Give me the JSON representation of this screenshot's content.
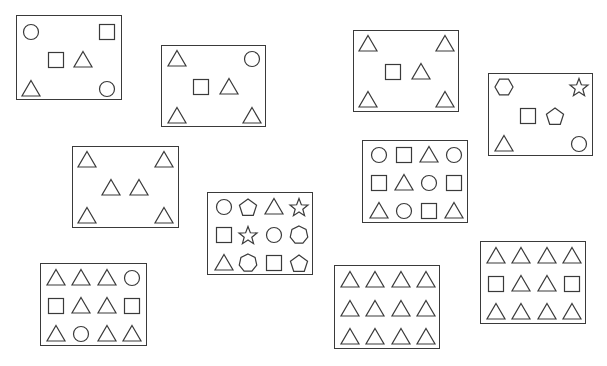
{
  "diagram": {
    "stroke_color": "#3a3a3a",
    "background_color": "#ffffff",
    "panels": [
      {
        "id": "panel-1",
        "box": [
          16,
          15,
          106,
          85
        ],
        "shapes": [
          {
            "type": "circle",
            "x": 14,
            "y": 16
          },
          {
            "type": "square",
            "x": 90,
            "y": 16
          },
          {
            "type": "square",
            "x": 39,
            "y": 44
          },
          {
            "type": "triangle",
            "x": 66,
            "y": 44
          },
          {
            "type": "triangle",
            "x": 14,
            "y": 73
          },
          {
            "type": "circle",
            "x": 90,
            "y": 73
          }
        ]
      },
      {
        "id": "panel-2",
        "box": [
          161,
          45,
          105,
          82
        ],
        "shapes": [
          {
            "type": "triangle",
            "x": 15,
            "y": 13
          },
          {
            "type": "circle",
            "x": 90,
            "y": 13
          },
          {
            "type": "square",
            "x": 39,
            "y": 41
          },
          {
            "type": "triangle",
            "x": 67,
            "y": 41
          },
          {
            "type": "triangle",
            "x": 15,
            "y": 70
          },
          {
            "type": "triangle",
            "x": 90,
            "y": 70
          }
        ]
      },
      {
        "id": "panel-3",
        "box": [
          353,
          30,
          106,
          82
        ],
        "shapes": [
          {
            "type": "triangle",
            "x": 14,
            "y": 13
          },
          {
            "type": "triangle",
            "x": 91,
            "y": 13
          },
          {
            "type": "square",
            "x": 39,
            "y": 41
          },
          {
            "type": "triangle",
            "x": 67,
            "y": 41
          },
          {
            "type": "triangle",
            "x": 14,
            "y": 69
          },
          {
            "type": "triangle",
            "x": 91,
            "y": 69
          }
        ]
      },
      {
        "id": "panel-4",
        "box": [
          488,
          73,
          105,
          83
        ],
        "shapes": [
          {
            "type": "hexagon",
            "x": 15,
            "y": 13
          },
          {
            "type": "star",
            "x": 90,
            "y": 13
          },
          {
            "type": "square",
            "x": 39,
            "y": 42
          },
          {
            "type": "pentagon",
            "x": 66,
            "y": 42
          },
          {
            "type": "triangle",
            "x": 15,
            "y": 70
          },
          {
            "type": "circle",
            "x": 90,
            "y": 70
          }
        ]
      },
      {
        "id": "panel-5",
        "box": [
          72,
          146,
          107,
          82
        ],
        "shapes": [
          {
            "type": "triangle",
            "x": 14,
            "y": 13
          },
          {
            "type": "triangle",
            "x": 91,
            "y": 13
          },
          {
            "type": "triangle",
            "x": 38,
            "y": 41
          },
          {
            "type": "triangle",
            "x": 66,
            "y": 41
          },
          {
            "type": "triangle",
            "x": 14,
            "y": 69
          },
          {
            "type": "triangle",
            "x": 91,
            "y": 69
          }
        ]
      },
      {
        "id": "panel-6",
        "box": [
          207,
          192,
          106,
          83
        ],
        "shapes": [
          {
            "type": "circle",
            "x": 16,
            "y": 14
          },
          {
            "type": "pentagon",
            "x": 40,
            "y": 14
          },
          {
            "type": "triangle",
            "x": 66,
            "y": 14
          },
          {
            "type": "star",
            "x": 91,
            "y": 14
          },
          {
            "type": "square",
            "x": 16,
            "y": 42
          },
          {
            "type": "star",
            "x": 40,
            "y": 42
          },
          {
            "type": "circle",
            "x": 66,
            "y": 42
          },
          {
            "type": "heptagon",
            "x": 91,
            "y": 42
          },
          {
            "type": "triangle",
            "x": 16,
            "y": 70
          },
          {
            "type": "heptagon",
            "x": 40,
            "y": 70
          },
          {
            "type": "square",
            "x": 66,
            "y": 70
          },
          {
            "type": "pentagon",
            "x": 91,
            "y": 70
          }
        ]
      },
      {
        "id": "panel-7",
        "box": [
          362,
          140,
          106,
          83
        ],
        "shapes": [
          {
            "type": "circle",
            "x": 16,
            "y": 14
          },
          {
            "type": "square",
            "x": 41,
            "y": 14
          },
          {
            "type": "triangle",
            "x": 66,
            "y": 14
          },
          {
            "type": "circle",
            "x": 91,
            "y": 14
          },
          {
            "type": "square",
            "x": 16,
            "y": 42
          },
          {
            "type": "triangle",
            "x": 41,
            "y": 42
          },
          {
            "type": "circle",
            "x": 66,
            "y": 42
          },
          {
            "type": "square",
            "x": 91,
            "y": 42
          },
          {
            "type": "triangle",
            "x": 16,
            "y": 70
          },
          {
            "type": "circle",
            "x": 41,
            "y": 70
          },
          {
            "type": "square",
            "x": 66,
            "y": 70
          },
          {
            "type": "triangle",
            "x": 91,
            "y": 70
          }
        ]
      },
      {
        "id": "panel-8",
        "box": [
          40,
          263,
          107,
          83
        ],
        "shapes": [
          {
            "type": "triangle",
            "x": 15,
            "y": 14
          },
          {
            "type": "triangle",
            "x": 40,
            "y": 14
          },
          {
            "type": "triangle",
            "x": 66,
            "y": 14
          },
          {
            "type": "circle",
            "x": 91,
            "y": 14
          },
          {
            "type": "square",
            "x": 15,
            "y": 42
          },
          {
            "type": "triangle",
            "x": 40,
            "y": 42
          },
          {
            "type": "triangle",
            "x": 66,
            "y": 42
          },
          {
            "type": "square",
            "x": 91,
            "y": 42
          },
          {
            "type": "triangle",
            "x": 15,
            "y": 70
          },
          {
            "type": "circle",
            "x": 40,
            "y": 70
          },
          {
            "type": "triangle",
            "x": 66,
            "y": 70
          },
          {
            "type": "triangle",
            "x": 91,
            "y": 70
          }
        ]
      },
      {
        "id": "panel-9",
        "box": [
          334,
          265,
          106,
          84
        ],
        "shapes": [
          {
            "type": "triangle",
            "x": 15,
            "y": 14
          },
          {
            "type": "triangle",
            "x": 40,
            "y": 14
          },
          {
            "type": "triangle",
            "x": 66,
            "y": 14
          },
          {
            "type": "triangle",
            "x": 91,
            "y": 14
          },
          {
            "type": "triangle",
            "x": 15,
            "y": 43
          },
          {
            "type": "triangle",
            "x": 40,
            "y": 43
          },
          {
            "type": "triangle",
            "x": 66,
            "y": 43
          },
          {
            "type": "triangle",
            "x": 91,
            "y": 43
          },
          {
            "type": "triangle",
            "x": 15,
            "y": 71
          },
          {
            "type": "triangle",
            "x": 40,
            "y": 71
          },
          {
            "type": "triangle",
            "x": 66,
            "y": 71
          },
          {
            "type": "triangle",
            "x": 91,
            "y": 71
          }
        ]
      },
      {
        "id": "panel-10",
        "box": [
          480,
          241,
          106,
          83
        ],
        "shapes": [
          {
            "type": "triangle",
            "x": 15,
            "y": 14
          },
          {
            "type": "triangle",
            "x": 40,
            "y": 14
          },
          {
            "type": "triangle",
            "x": 66,
            "y": 14
          },
          {
            "type": "triangle",
            "x": 91,
            "y": 14
          },
          {
            "type": "square",
            "x": 15,
            "y": 42
          },
          {
            "type": "triangle",
            "x": 40,
            "y": 42
          },
          {
            "type": "triangle",
            "x": 66,
            "y": 42
          },
          {
            "type": "square",
            "x": 91,
            "y": 42
          },
          {
            "type": "triangle",
            "x": 15,
            "y": 70
          },
          {
            "type": "triangle",
            "x": 40,
            "y": 70
          },
          {
            "type": "triangle",
            "x": 66,
            "y": 70
          },
          {
            "type": "triangle",
            "x": 91,
            "y": 70
          }
        ]
      }
    ]
  }
}
